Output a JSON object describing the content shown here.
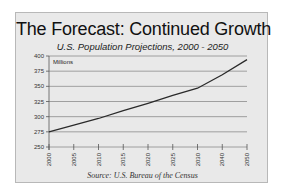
{
  "chart_data": {
    "type": "line",
    "title": "The Forecast:  Continued Growth",
    "subtitle": "U.S. Population Projections, 2000 - 2050",
    "source": "Source: U.S. Bureau of the Census",
    "xlabel": "",
    "ylabel": "Millions",
    "categories": [
      "2000",
      "2005",
      "2010",
      "2015",
      "2020",
      "2025",
      "2030",
      "2040",
      "2050"
    ],
    "series": [
      {
        "name": "U.S. Population (Millions)",
        "values": [
          275,
          286,
          297,
          310,
          322,
          335,
          347,
          369,
          394
        ]
      }
    ],
    "yticks": [
      250,
      275,
      300,
      325,
      350,
      375,
      400
    ],
    "ylim": [
      250,
      400
    ],
    "grid": true,
    "legend": "none"
  },
  "colors": {
    "card_background": "#e9e9e9",
    "gridline": "#8c8c8c",
    "line": "#2a2a2a"
  }
}
